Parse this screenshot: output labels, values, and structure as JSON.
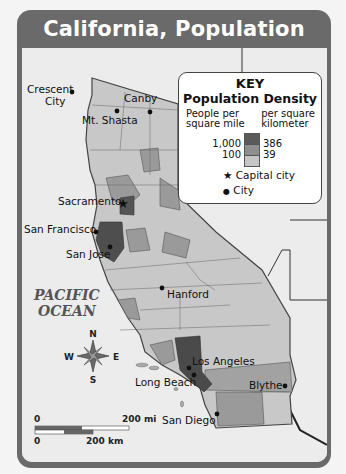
{
  "title": "California, Population",
  "key": {
    "heading": "KEY",
    "subheading": "Population Density",
    "col_left": "People per square mile",
    "col_left_line1": "People per",
    "col_left_line2": "square mile",
    "col_right_line1": "per square",
    "col_right_line2": "kilometer",
    "thresholds_mi": [
      "1,000",
      "100"
    ],
    "thresholds_km": [
      "386",
      "39"
    ],
    "shades": [
      "#5a5a5a",
      "#8f8f8f",
      "#c6c6c6"
    ],
    "capital_symbol": "★",
    "capital_label": "Capital city",
    "city_symbol": "●",
    "city_label": "City"
  },
  "ocean_label": {
    "line1": "PACIFIC",
    "line2": "OCEAN"
  },
  "cities": [
    {
      "name": "Crescent City",
      "type": "city"
    },
    {
      "name": "Canby",
      "type": "city"
    },
    {
      "name": "Mt. Shasta",
      "type": "city"
    },
    {
      "name": "Sacramento",
      "type": "capital"
    },
    {
      "name": "San Francisco",
      "type": "city"
    },
    {
      "name": "San Jose",
      "type": "city"
    },
    {
      "name": "Hanford",
      "type": "city"
    },
    {
      "name": "Los Angeles",
      "type": "city"
    },
    {
      "name": "Long Beach",
      "type": "city"
    },
    {
      "name": "Blythe",
      "type": "city"
    },
    {
      "name": "San Diego",
      "type": "city"
    }
  ],
  "compass": {
    "n": "N",
    "s": "S",
    "e": "E",
    "w": "W"
  },
  "scale_bar": {
    "zero": "0",
    "miles": "200 mi",
    "km": "200 km"
  }
}
